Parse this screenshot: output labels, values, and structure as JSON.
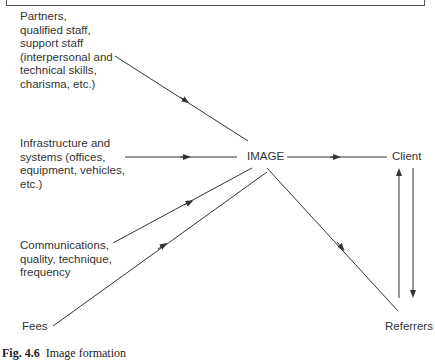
{
  "header": {
    "partial_title": "...QUALITY"
  },
  "diagram": {
    "central_node": "IMAGE",
    "inputs": [
      {
        "id": "people",
        "label": "Partners,\nqualified staff,\nsupport staff\n(interpersonal and\ntechnical skills,\ncharisma, etc.)"
      },
      {
        "id": "infrastructure",
        "label": "Infrastructure and\nsystems (offices,\nequipment, vehicles,\netc.)"
      },
      {
        "id": "communications",
        "label": "Communications,\nquality, technique,\nfrequency"
      },
      {
        "id": "fees",
        "label": "Fees"
      }
    ],
    "outputs": [
      {
        "id": "client",
        "label": "Client"
      },
      {
        "id": "referrers",
        "label": "Referrers"
      }
    ],
    "edges": [
      {
        "from": "people",
        "to": "IMAGE"
      },
      {
        "from": "infrastructure",
        "to": "IMAGE"
      },
      {
        "from": "communications",
        "to": "IMAGE"
      },
      {
        "from": "fees",
        "to": "IMAGE"
      },
      {
        "from": "IMAGE",
        "to": "client"
      },
      {
        "from": "IMAGE",
        "to": "referrers"
      },
      {
        "from": "referrers",
        "to": "client"
      },
      {
        "from": "client",
        "to": "referrers"
      }
    ],
    "line_color": "#333333"
  },
  "caption": {
    "number": "Fig. 4.6",
    "text": "Image formation"
  }
}
